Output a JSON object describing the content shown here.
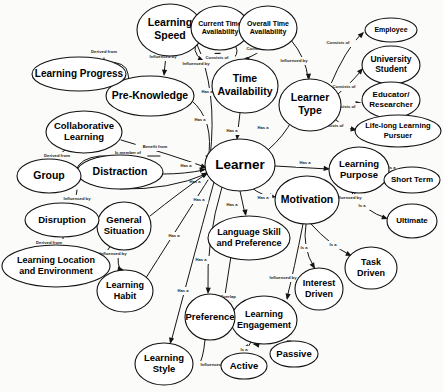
{
  "diagram": {
    "type": "concept-map",
    "background_color": "#fbfbfa",
    "node_fill": "#ffffff",
    "node_stroke": "#111111",
    "edge_color": "#151515",
    "text_color": "#000000"
  },
  "nodes": [
    {
      "id": "learner",
      "label": "Learner",
      "lines": [
        "Learner"
      ],
      "cx": 240,
      "cy": 165,
      "rx": 35,
      "ry": 26,
      "font": 13.5
    },
    {
      "id": "learning_speed",
      "label": "Learning Speed",
      "lines": [
        "Learning",
        "Speed"
      ],
      "cx": 170,
      "cy": 30,
      "rx": 33,
      "ry": 26,
      "font": 10.5
    },
    {
      "id": "pre_knowledge",
      "label": "Pre-Knowledge",
      "lines": [
        "Pre-Knowledge"
      ],
      "cx": 150,
      "cy": 96,
      "rx": 44,
      "ry": 20,
      "font": 10.5
    },
    {
      "id": "learning_progress",
      "label": "Learning Progress",
      "lines": [
        "Learning Progress"
      ],
      "cx": 79,
      "cy": 74,
      "rx": 47,
      "ry": 17,
      "font": 10
    },
    {
      "id": "current_time",
      "label": "Current Time Availability",
      "lines": [
        "Current Time",
        "Availability"
      ],
      "cx": 220,
      "cy": 28,
      "rx": 29,
      "ry": 22,
      "font": 7
    },
    {
      "id": "overall_time",
      "label": "Overall Time Availability",
      "lines": [
        "Overall Time",
        "Availability"
      ],
      "cx": 268,
      "cy": 28,
      "rx": 29,
      "ry": 22,
      "font": 7
    },
    {
      "id": "time_avail",
      "label": "Time Availability",
      "lines": [
        "Time",
        "Availability"
      ],
      "cx": 245,
      "cy": 86,
      "rx": 33,
      "ry": 27,
      "font": 10.5
    },
    {
      "id": "learner_type",
      "label": "Learner Type",
      "lines": [
        "Learner",
        "Type"
      ],
      "cx": 310,
      "cy": 105,
      "rx": 31,
      "ry": 26,
      "font": 10.5
    },
    {
      "id": "employee",
      "label": "Employee",
      "lines": [
        "Employee"
      ],
      "cx": 391,
      "cy": 30,
      "rx": 26,
      "ry": 12,
      "font": 7
    },
    {
      "id": "university_student",
      "label": "University Student",
      "lines": [
        "University",
        "Student"
      ],
      "cx": 391,
      "cy": 65,
      "rx": 29,
      "ry": 19,
      "font": 8.5
    },
    {
      "id": "educator",
      "label": "Educator/ Researcher",
      "lines": [
        "Educator/",
        "Researcher"
      ],
      "cx": 391,
      "cy": 100,
      "rx": 29,
      "ry": 18,
      "font": 8
    },
    {
      "id": "lifelong",
      "label": "Life-long Learning Pursuer",
      "lines": [
        "Life-long Learning",
        "Pursuer"
      ],
      "cx": 398,
      "cy": 131,
      "rx": 43,
      "ry": 16,
      "font": 7.5
    },
    {
      "id": "learning_purpose",
      "label": "Learning Purpose",
      "lines": [
        "Learning",
        "Purpose"
      ],
      "cx": 359,
      "cy": 170,
      "rx": 30,
      "ry": 23,
      "font": 9.5
    },
    {
      "id": "short_term",
      "label": "Short Term",
      "lines": [
        "Short Term"
      ],
      "cx": 412,
      "cy": 180,
      "rx": 28,
      "ry": 13,
      "font": 8
    },
    {
      "id": "ultimate",
      "label": "Ultimate",
      "lines": [
        "Ultimate"
      ],
      "cx": 412,
      "cy": 221,
      "rx": 25,
      "ry": 17,
      "font": 8
    },
    {
      "id": "motivation",
      "label": "Motivation",
      "lines": [
        "Motivation"
      ],
      "cx": 307,
      "cy": 200,
      "rx": 32,
      "ry": 24,
      "font": 10.5
    },
    {
      "id": "task_driven",
      "label": "Task Driven",
      "lines": [
        "Task",
        "Driven"
      ],
      "cx": 371,
      "cy": 268,
      "rx": 26,
      "ry": 21,
      "font": 9
    },
    {
      "id": "interest_driven",
      "label": "Interest Driven",
      "lines": [
        "Interest",
        "Driven"
      ],
      "cx": 319,
      "cy": 289,
      "rx": 24,
      "ry": 21,
      "font": 9
    },
    {
      "id": "language_skill",
      "label": "Language Skill and Preference",
      "lines": [
        "Language Skill",
        "and Preference"
      ],
      "cx": 249,
      "cy": 238,
      "rx": 41,
      "ry": 22,
      "font": 9
    },
    {
      "id": "learning_engagement",
      "label": "Learning Engagement",
      "lines": [
        "Learning",
        "Engagement"
      ],
      "cx": 264,
      "cy": 320,
      "rx": 33,
      "ry": 24,
      "font": 9
    },
    {
      "id": "active",
      "label": "Active",
      "lines": [
        "Active"
      ],
      "cx": 244,
      "cy": 366,
      "rx": 23,
      "ry": 13,
      "font": 9.5
    },
    {
      "id": "passive",
      "label": "Passive",
      "lines": [
        "Passive"
      ],
      "cx": 294,
      "cy": 354,
      "rx": 24,
      "ry": 13,
      "font": 9.5
    },
    {
      "id": "preference",
      "label": "Preference",
      "lines": [
        "Preference"
      ],
      "cx": 210,
      "cy": 317,
      "rx": 25,
      "ry": 23,
      "font": 9.5
    },
    {
      "id": "learning_style",
      "label": "Learning Style",
      "lines": [
        "Learning",
        "Style"
      ],
      "cx": 164,
      "cy": 364,
      "rx": 29,
      "ry": 21,
      "font": 9.5
    },
    {
      "id": "learning_habit",
      "label": "Learning Habit",
      "lines": [
        "Learning",
        "Habit"
      ],
      "cx": 125,
      "cy": 291,
      "rx": 28,
      "ry": 21,
      "font": 9
    },
    {
      "id": "general_situation",
      "label": "General Situation",
      "lines": [
        "General",
        "Situation"
      ],
      "cx": 124,
      "cy": 226,
      "rx": 27,
      "ry": 24,
      "font": 9.5
    },
    {
      "id": "disruption",
      "label": "Disruption",
      "lines": [
        "Disruption"
      ],
      "cx": 62,
      "cy": 220,
      "rx": 37,
      "ry": 17,
      "font": 9.5
    },
    {
      "id": "learning_location",
      "label": "Learning Location and Environment",
      "lines": [
        "Learning Location",
        "and Environment"
      ],
      "cx": 56,
      "cy": 266,
      "rx": 54,
      "ry": 21,
      "font": 9
    },
    {
      "id": "distraction",
      "label": "Distraction",
      "lines": [
        "Distraction"
      ],
      "cx": 120,
      "cy": 172,
      "rx": 43,
      "ry": 17,
      "font": 10.5
    },
    {
      "id": "group",
      "label": "Group",
      "lines": [
        "Group"
      ],
      "cx": 49,
      "cy": 176,
      "rx": 32,
      "ry": 17,
      "font": 10.5
    },
    {
      "id": "collaborative",
      "label": "Collaborative Learning",
      "lines": [
        "Collaborative",
        "Learning"
      ],
      "cx": 84,
      "cy": 132,
      "rx": 38,
      "ry": 21,
      "font": 9.5
    }
  ],
  "edges": [
    {
      "id": "e1",
      "from": "learning_progress",
      "to": "pre_knowledge",
      "label": "Derived from",
      "label_x": 104,
      "label_y": 52,
      "path": "M 104 58 L 104 62 Q 127 61 128 74 L 130 88 Q 131 96 119 95 L 108 95",
      "arrow": {
        "x": 108,
        "y": 95,
        "angle": 180
      }
    },
    {
      "id": "e2",
      "from": "learning_speed",
      "to": "pre_knowledge",
      "label": "Influenced by",
      "label_x": 163,
      "label_y": 57,
      "path": "M 166 56 L 164 74",
      "arrow": {
        "x": 164,
        "y": 76,
        "angle": 95
      }
    },
    {
      "id": "e3",
      "from": "pre_knowledge",
      "to": "learner",
      "label": "Has a",
      "label_x": 200,
      "label_y": 120,
      "path": "M 191 100 Q 215 120 208 160",
      "arrow": {
        "x": 207,
        "y": 162,
        "angle": 100
      }
    },
    {
      "id": "e4",
      "from": "learning_speed",
      "to": "learner",
      "label": "Has a",
      "label_x": 207,
      "label_y": 92,
      "path": "M 196 42 Q 218 90 210 158",
      "arrow": {
        "x": 209,
        "y": 160,
        "angle": 100
      }
    },
    {
      "id": "e5",
      "from": "current_time",
      "to": "time_avail",
      "label": "Consists of",
      "label_x": 217,
      "label_y": 58,
      "path": "M 236 47 Q 240 55 230 61",
      "arrow": {
        "x": 214,
        "y": 53,
        "angle": 200
      }
    },
    {
      "id": "e6",
      "from": "overall_time",
      "to": "time_avail",
      "label": "Consists of",
      "label_x": 258,
      "label_y": 49,
      "path": "M 262 50 Q 250 58 246 58",
      "arrow": {
        "x": 243,
        "y": 59,
        "angle": 185
      }
    },
    {
      "id": "e7",
      "from": "current_time",
      "to": "learning_speed",
      "label": "Influenced by",
      "label_x": 196,
      "label_y": 64,
      "path": "M 198 38 Q 190 52 202 60",
      "arrow": {
        "x": 204,
        "y": 61,
        "angle": 25
      }
    },
    {
      "id": "e8",
      "from": "time_avail",
      "to": "learner",
      "label": "Has a",
      "label_x": 232,
      "label_y": 131,
      "path": "M 240 113 L 237 138",
      "arrow": {
        "x": 237,
        "y": 140,
        "angle": 95
      }
    },
    {
      "id": "e9",
      "from": "overall_time",
      "to": "learner_type",
      "label": "Influenced by",
      "label_x": 294,
      "label_y": 61,
      "path": "M 291 40 Q 306 58 308 78",
      "arrow": {
        "x": 309,
        "y": 80,
        "angle": 85
      }
    },
    {
      "id": "e10",
      "from": "learner",
      "to": "learner_type",
      "label": "Has a",
      "label_x": 263,
      "label_y": 128,
      "path": "M 268 150 Q 285 135 292 120",
      "arrow": {
        "x": 294,
        "y": 118,
        "angle": 305
      }
    },
    {
      "id": "e11",
      "from": "learner_type",
      "to": "employee",
      "label": "Consists of",
      "label_x": 338,
      "label_y": 43,
      "path": "M 330 86 Q 345 50 362 33",
      "arrow": {
        "x": 364,
        "y": 32,
        "angle": 315
      }
    },
    {
      "id": "e12",
      "from": "learner_type",
      "to": "university_student",
      "label": "Consists of",
      "label_x": 344,
      "label_y": 87,
      "path": "M 337 95 Q 352 82 362 70",
      "arrow": {
        "x": 363,
        "y": 68,
        "angle": 310
      }
    },
    {
      "id": "e13",
      "from": "learner_type",
      "to": "educator",
      "label": "Consists of",
      "label_x": 344,
      "label_y": 107,
      "path": "M 341 106 L 360 103",
      "arrow": {
        "x": 362,
        "y": 103,
        "angle": 355
      }
    },
    {
      "id": "e14",
      "from": "learner_type",
      "to": "lifelong",
      "label": "Consists of",
      "label_x": 332,
      "label_y": 126,
      "path": "M 336 120 Q 345 128 355 130",
      "arrow": {
        "x": 357,
        "y": 130,
        "angle": 10
      }
    },
    {
      "id": "e15",
      "from": "learner",
      "to": "learning_purpose",
      "label": "Has a",
      "label_x": 305,
      "label_y": 163,
      "path": "M 275 166 L 328 169",
      "arrow": {
        "x": 330,
        "y": 169,
        "angle": 5
      }
    },
    {
      "id": "e16",
      "from": "learning_purpose",
      "to": "short_term",
      "label": "Is a",
      "label_x": 392,
      "label_y": 168,
      "path": "M 389 172 L 385 178",
      "arrow": {
        "x": 384,
        "y": 179,
        "angle": 150
      }
    },
    {
      "id": "e17",
      "from": "learning_purpose",
      "to": "ultimate",
      "label": "Is a",
      "label_x": 362,
      "label_y": 206,
      "path": "M 352 193 Q 366 212 386 218",
      "arrow": {
        "x": 388,
        "y": 219,
        "angle": 20
      }
    },
    {
      "id": "e18",
      "from": "learning_purpose",
      "to": "motivation",
      "label": "Influenced by",
      "label_x": 348,
      "label_y": 198,
      "path": "M 355 193 L 352 199 L 341 199",
      "arrow": {
        "x": 339,
        "y": 199,
        "angle": 180
      }
    },
    {
      "id": "e19",
      "from": "learner",
      "to": "motivation",
      "label": "Has a",
      "label_x": 263,
      "label_y": 198,
      "path": "M 252 188 Q 262 196 274 197",
      "arrow": {
        "x": 276,
        "y": 197,
        "angle": 10
      }
    },
    {
      "id": "e20",
      "from": "motivation",
      "to": "task_driven",
      "label": "Is a",
      "label_x": 333,
      "label_y": 245,
      "path": "M 311 224 Q 330 245 350 255",
      "arrow": {
        "x": 352,
        "y": 256,
        "angle": 25
      }
    },
    {
      "id": "e21",
      "from": "motivation",
      "to": "interest_driven",
      "label": "Is a",
      "label_x": 304,
      "label_y": 248,
      "path": "M 306 224 Q 302 248 314 267",
      "arrow": {
        "x": 315,
        "y": 269,
        "angle": 60
      }
    },
    {
      "id": "e22",
      "from": "motivation",
      "to": "learning_engagement",
      "label": "Influenced by",
      "label_x": 283,
      "label_y": 278,
      "path": "M 303 224 Q 294 270 287 298",
      "arrow": {
        "x": 287,
        "y": 300,
        "angle": 100
      }
    },
    {
      "id": "e23",
      "from": "learner",
      "to": "language_skill",
      "label": "Has a",
      "label_x": 232,
      "label_y": 205,
      "path": "M 240 191 L 245 214",
      "arrow": {
        "x": 246,
        "y": 216,
        "angle": 80
      }
    },
    {
      "id": "e24",
      "from": "language_skill",
      "to": "learning_engagement",
      "label": "Overlap",
      "label_x": 228,
      "label_y": 297,
      "path": "M 231 256 L 225 295 Q 224 299 230 299 L 236 299",
      "arrow": {
        "x": 238,
        "y": 299,
        "angle": 0
      }
    },
    {
      "id": "e25",
      "from": "learning_engagement",
      "to": "active",
      "label": "Is a",
      "label_x": 244,
      "label_y": 350,
      "path": "M 251 342 Q 245 352 245 353",
      "arrow": {
        "x": 248,
        "y": 344,
        "angle": 300
      }
    },
    {
      "id": "e26",
      "from": "learning_engagement",
      "to": "passive",
      "label": "Is a",
      "label_x": 279,
      "label_y": 338,
      "path": "M 254 344 Q 275 340 291 341",
      "arrow": {
        "x": 253,
        "y": 344,
        "angle": 190
      }
    },
    {
      "id": "e27",
      "from": "learner",
      "to": "preference",
      "label": "Has a",
      "label_x": 201,
      "label_y": 260,
      "path": "M 222 187 Q 206 240 208 292",
      "arrow": {
        "x": 208,
        "y": 294,
        "angle": 92
      }
    },
    {
      "id": "e28",
      "from": "preference",
      "to": "learning_style",
      "label": "Influenced by",
      "label_x": 214,
      "label_y": 365,
      "path": "M 205 340 Q 203 360 199 364",
      "arrow": {
        "x": 195,
        "y": 364,
        "angle": 180
      }
    },
    {
      "id": "e29",
      "from": "learner",
      "to": "learning_style",
      "label": "Has a",
      "label_x": 183,
      "label_y": 291,
      "path": "M 214 182 Q 190 270 171 342",
      "arrow": {
        "x": 170,
        "y": 344,
        "angle": 105
      }
    },
    {
      "id": "e30",
      "from": "learner",
      "to": "learning_habit",
      "label": "Has a",
      "label_x": 174,
      "label_y": 236,
      "path": "M 208 180 Q 170 240 144 281",
      "arrow": {
        "x": 143,
        "y": 283,
        "angle": 122
      }
    },
    {
      "id": "e31",
      "from": "general_situation",
      "to": "learning_habit",
      "label": "Influenced by",
      "label_x": 113,
      "label_y": 254,
      "path": "M 119 250 Q 116 268 122 270",
      "arrow": {
        "x": 124,
        "y": 270,
        "angle": 10
      }
    },
    {
      "id": "e32",
      "from": "general_situation",
      "to": "learning_location",
      "label": "Influenced by",
      "label_x": 113,
      "label_y": 254,
      "path": "M 111 245 Q 102 262 86 266",
      "arrow": {
        "x": 84,
        "y": 266,
        "angle": 185
      }
    },
    {
      "id": "e33",
      "from": "disruption",
      "to": "learning_location",
      "label": "Derived from",
      "label_x": 49,
      "label_y": 243,
      "path": "M 63 237 L 63 245",
      "arrow": {
        "x": 63,
        "y": 240,
        "angle": 270
      }
    },
    {
      "id": "e34",
      "from": "group",
      "to": "disruption",
      "label": "Influenced by",
      "label_x": 77,
      "label_y": 199,
      "path": "M 77 190 Q 76 200 72 204",
      "arrow": {
        "x": 71,
        "y": 206,
        "angle": 110
      }
    },
    {
      "id": "e35",
      "from": "collaborative",
      "to": "group",
      "label": "Derived from",
      "label_x": 57,
      "label_y": 156,
      "path": "M 65 150 Q 58 155 55 159",
      "arrow": {
        "x": 54,
        "y": 161,
        "angle": 120
      }
    },
    {
      "id": "e36",
      "from": "collaborative",
      "to": "learner",
      "label": "Benefit from",
      "label_x": 155,
      "label_y": 147,
      "path": "M 121 140 Q 175 156 205 167",
      "arrow": {
        "x": 207,
        "y": 168,
        "angle": 20
      }
    },
    {
      "id": "e37",
      "from": "distraction",
      "to": "learner",
      "label": "Has a",
      "label_x": 195,
      "label_y": 182,
      "path": "M 163 174 Q 185 174 204 170",
      "arrow": {
        "x": 206,
        "y": 169,
        "angle": 350
      }
    },
    {
      "id": "e38",
      "from": "group",
      "to": "distraction",
      "label": "Is member of",
      "label_x": 128,
      "label_y": 153,
      "path": "M 160 156 L 100 156 Q 80 158 76 170",
      "arrow": {
        "x": 79,
        "y": 174,
        "angle": 120
      }
    },
    {
      "id": "e39",
      "from": "general_situation",
      "to": "learner",
      "label": "Has a",
      "label_x": 186,
      "label_y": 166,
      "path": "M 150 216 Q 180 192 206 174",
      "arrow": {
        "x": 208,
        "y": 172,
        "angle": 325
      }
    },
    {
      "id": "e40",
      "from": "distraction2",
      "to": "learner",
      "label": "Has a",
      "label_x": 199,
      "label_y": 200,
      "path": "M 120 189 Q 170 190 206 174",
      "arrow": {
        "x": 208,
        "y": 173,
        "angle": 335
      }
    }
  ]
}
